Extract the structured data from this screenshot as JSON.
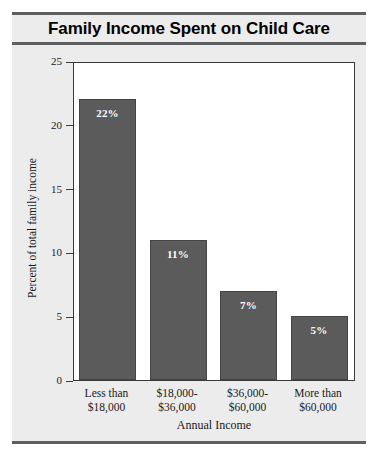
{
  "chart_data": {
    "type": "bar",
    "title": "Family Income Spent on Child Care",
    "xlabel": "Annual Income",
    "ylabel": "Percent of total family income",
    "categories": [
      "Less than\n$18,000",
      "$18,000-\n$36,000",
      "$36,000-\n$60,000",
      "More than\n$60,000"
    ],
    "category_lines": [
      [
        "Less than",
        "$18,000"
      ],
      [
        "$18,000-",
        "$36,000"
      ],
      [
        "$36,000-",
        "$60,000"
      ],
      [
        "More than",
        "$60,000"
      ]
    ],
    "values": [
      22,
      11,
      7,
      5
    ],
    "data_labels": [
      "22%",
      "11%",
      "7%",
      "5%"
    ],
    "ylim": [
      0,
      25
    ],
    "yticks": [
      0,
      5,
      10,
      15,
      20,
      25
    ],
    "ytick_labels": [
      "0",
      "5",
      "10",
      "15",
      "20",
      "25"
    ],
    "grid": false,
    "legend": false,
    "bar_color": "#5b5b5b",
    "bar_edge_color": "#454545",
    "label_color": "#ffffff",
    "plot_background": "#ffffff",
    "panel_background": "#ececed",
    "rule_color": "#5d5f61"
  }
}
